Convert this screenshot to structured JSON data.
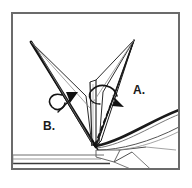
{
  "figure": {
    "kind": "origami-folding-instruction-diagram",
    "title": "",
    "background_color": "#ffffff",
    "ink_color": "#1a1a1a",
    "frame": {
      "border_color": "#6b6b6b",
      "border_width_px": 2,
      "x": 11,
      "y": 12,
      "width": 169,
      "height": 158
    }
  },
  "labels": [
    {
      "id": "a",
      "text": "A.",
      "x": 133,
      "y": 84,
      "refers_to": "right-spike-rotation"
    },
    {
      "id": "b",
      "text": "B.",
      "x": 43,
      "y": 120,
      "refers_to": "left-spike-rotation"
    }
  ],
  "annotations": {
    "label_a": "A.",
    "label_b": "B."
  },
  "shapes": {
    "apex": {
      "x": 95,
      "y": 146
    },
    "left_spike": {
      "name": "left-spike",
      "tip": {
        "x": 31,
        "y": 42
      },
      "base_left": {
        "x": 91,
        "y": 143
      },
      "base_right": {
        "x": 97,
        "y": 147
      },
      "inner_fold": {
        "x": 86,
        "y": 96
      }
    },
    "right_spike": {
      "name": "right-spike",
      "tip": {
        "x": 134,
        "y": 40
      },
      "base_left": {
        "x": 95,
        "y": 144
      },
      "base_right": {
        "x": 101,
        "y": 140
      },
      "inner_fold": {
        "x": 104,
        "y": 92
      }
    },
    "center_column": {
      "name": "center-column",
      "top": {
        "x": 92,
        "y": 84
      },
      "bottom": {
        "x": 95,
        "y": 146
      },
      "width_px": 6
    },
    "right_wing": {
      "name": "right-wing-curved-flap",
      "start": {
        "x": 96,
        "y": 146
      },
      "control": {
        "x": 134,
        "y": 104
      },
      "end": {
        "x": 178,
        "y": 111
      }
    },
    "base_line": {
      "name": "base-ground-line",
      "y_top": 155,
      "y_bottom": 163,
      "x_start": 13,
      "x_end": 110
    },
    "dashed_fold": {
      "name": "dashed-fold-line",
      "from": {
        "x": 95,
        "y": 145
      },
      "to": {
        "x": 113,
        "y": 99
      },
      "style": "dashed"
    }
  },
  "arrows": [
    {
      "id": "arrow-a",
      "name": "rotation-arrow-a",
      "direction": "clockwise-down-right",
      "head": {
        "x": 120,
        "y": 104
      },
      "loop_center": {
        "x": 104,
        "y": 96
      }
    },
    {
      "id": "arrow-b",
      "name": "rotation-arrow-b",
      "direction": "counterclockwise-up-right",
      "head": {
        "x": 74,
        "y": 96
      },
      "loop_center": {
        "x": 53,
        "y": 103
      }
    }
  ]
}
